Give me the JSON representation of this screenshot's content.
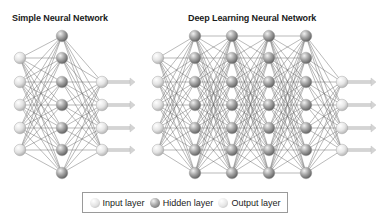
{
  "simple_network": {
    "title": "Simple Neural Network",
    "layers": [
      {
        "type": "input",
        "x": 20,
        "ys": [
          58,
          82,
          105,
          128,
          150
        ]
      },
      {
        "type": "hidden",
        "x": 62,
        "ys": [
          36,
          58,
          82,
          105,
          128,
          150,
          173
        ]
      },
      {
        "type": "output",
        "x": 102,
        "ys": [
          82,
          105,
          128,
          150
        ]
      }
    ],
    "arrow_end_x": 135
  },
  "deep_network": {
    "title": "Deep Learning Neural Network",
    "layers": [
      {
        "type": "input",
        "x": 158,
        "ys": [
          58,
          82,
          105,
          128,
          150
        ]
      },
      {
        "type": "hidden",
        "x": 195,
        "ys": [
          36,
          58,
          82,
          105,
          128,
          150,
          173
        ]
      },
      {
        "type": "hidden",
        "x": 232,
        "ys": [
          36,
          58,
          82,
          105,
          128,
          150,
          173
        ]
      },
      {
        "type": "hidden",
        "x": 269,
        "ys": [
          36,
          58,
          82,
          105,
          128,
          150,
          173
        ]
      },
      {
        "type": "hidden",
        "x": 306,
        "ys": [
          36,
          58,
          82,
          105,
          128,
          150,
          173
        ]
      },
      {
        "type": "output",
        "x": 342,
        "ys": [
          82,
          105,
          128,
          150
        ]
      }
    ],
    "arrow_end_x": 376
  },
  "legend": {
    "items": [
      {
        "type": "input",
        "label": "Input layer"
      },
      {
        "type": "hidden",
        "label": "Hidden layer"
      },
      {
        "type": "output",
        "label": "Output layer"
      }
    ]
  },
  "colors": {
    "input": "#e2e2e2",
    "hidden": "#a9a9a9",
    "output": "#e6e6e6",
    "edge": "#6a6a6a",
    "arrow": "#d4d4d4"
  }
}
